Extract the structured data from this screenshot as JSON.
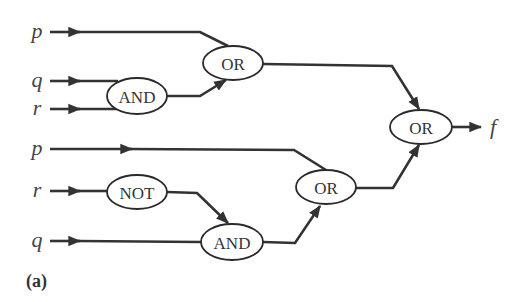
{
  "diagram": {
    "type": "logic-circuit",
    "caption": "(a)",
    "colors": {
      "wire": "#333333",
      "gate_stroke": "#2a2a2a",
      "gate_fill": "#ffffff",
      "text": "#333333"
    },
    "inputs": [
      {
        "id": "in_p1",
        "label": "p",
        "x": 37,
        "y": 32
      },
      {
        "id": "in_q1",
        "label": "q",
        "x": 37,
        "y": 81
      },
      {
        "id": "in_r1",
        "label": "r",
        "x": 37,
        "y": 109
      },
      {
        "id": "in_p2",
        "label": "p",
        "x": 37,
        "y": 149
      },
      {
        "id": "in_r2",
        "label": "r",
        "x": 37,
        "y": 191
      },
      {
        "id": "in_q2",
        "label": "q",
        "x": 37,
        "y": 241
      }
    ],
    "gates": [
      {
        "id": "and1",
        "label": "AND",
        "cx": 137,
        "cy": 96,
        "rx": 30,
        "ry": 18
      },
      {
        "id": "or1",
        "label": "OR",
        "cx": 233,
        "cy": 63,
        "rx": 30,
        "ry": 17
      },
      {
        "id": "not1",
        "label": "NOT",
        "cx": 137,
        "cy": 192,
        "rx": 30,
        "ry": 17
      },
      {
        "id": "and2",
        "label": "AND",
        "cx": 232,
        "cy": 242,
        "rx": 31,
        "ry": 18
      },
      {
        "id": "or2",
        "label": "OR",
        "cx": 326,
        "cy": 187,
        "rx": 30,
        "ry": 17
      },
      {
        "id": "or3",
        "label": "OR",
        "cx": 421,
        "cy": 127,
        "rx": 31,
        "ry": 17
      }
    ],
    "output": {
      "label": "f",
      "x": 492,
      "y": 127
    },
    "connections": [
      {
        "from": "p",
        "to": "or1"
      },
      {
        "from": "q",
        "to": "and1"
      },
      {
        "from": "r",
        "to": "and1"
      },
      {
        "from": "and1",
        "to": "or1"
      },
      {
        "from": "or1",
        "to": "or3"
      },
      {
        "from": "p",
        "to": "or2"
      },
      {
        "from": "r",
        "to": "not1"
      },
      {
        "from": "not1",
        "to": "and2"
      },
      {
        "from": "q",
        "to": "and2"
      },
      {
        "from": "and2",
        "to": "or2"
      },
      {
        "from": "or2",
        "to": "or3"
      },
      {
        "from": "or3",
        "to": "f"
      }
    ]
  }
}
